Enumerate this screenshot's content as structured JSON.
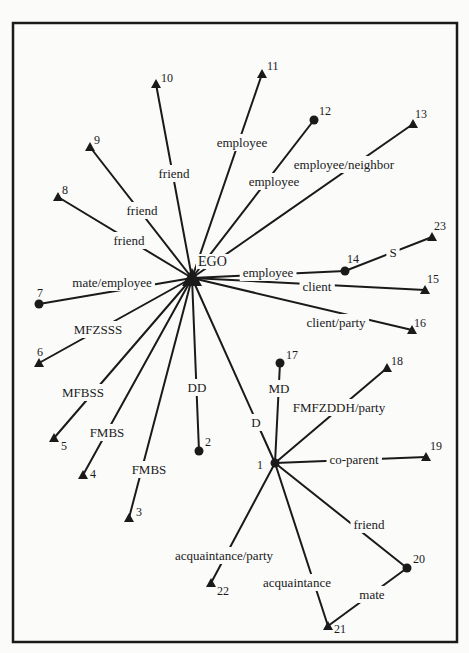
{
  "diagram": {
    "type": "ego-network",
    "frame": {
      "x": 13,
      "y": 23,
      "width": 444,
      "height": 619
    },
    "ego": {
      "id": "EGO",
      "label": "EGO",
      "shape": "triangle-large",
      "x": 192,
      "y": 278,
      "label_x": 198,
      "label_y": 266
    },
    "nodes": [
      {
        "id": "1",
        "label": "1",
        "shape": "circle",
        "x": 275,
        "y": 463,
        "lx": 257,
        "ly": 469
      },
      {
        "id": "2",
        "label": "2",
        "shape": "circle",
        "x": 199,
        "y": 451,
        "lx": 205,
        "ly": 446
      },
      {
        "id": "3",
        "label": "3",
        "shape": "triangle",
        "x": 129,
        "y": 518,
        "lx": 136,
        "ly": 516
      },
      {
        "id": "4",
        "label": "4",
        "shape": "triangle",
        "x": 83,
        "y": 475,
        "lx": 90,
        "ly": 478
      },
      {
        "id": "5",
        "label": "5",
        "shape": "triangle",
        "x": 54,
        "y": 438,
        "lx": 61,
        "ly": 450
      },
      {
        "id": "6",
        "label": "6",
        "shape": "triangle",
        "x": 39,
        "y": 363,
        "lx": 37,
        "ly": 356
      },
      {
        "id": "7",
        "label": "7",
        "shape": "circle",
        "x": 39,
        "y": 304,
        "lx": 37,
        "ly": 297
      },
      {
        "id": "8",
        "label": "8",
        "shape": "triangle",
        "x": 58,
        "y": 197,
        "lx": 62,
        "ly": 194
      },
      {
        "id": "9",
        "label": "9",
        "shape": "triangle",
        "x": 90,
        "y": 147,
        "lx": 94,
        "ly": 144
      },
      {
        "id": "10",
        "label": "10",
        "shape": "triangle",
        "x": 156,
        "y": 84,
        "lx": 161,
        "ly": 82
      },
      {
        "id": "11",
        "label": "11",
        "shape": "triangle",
        "x": 262,
        "y": 74,
        "lx": 267,
        "ly": 70
      },
      {
        "id": "12",
        "label": "12",
        "shape": "circle",
        "x": 314,
        "y": 120,
        "lx": 319,
        "ly": 115
      },
      {
        "id": "13",
        "label": "13",
        "shape": "triangle",
        "x": 413,
        "y": 124,
        "lx": 415,
        "ly": 118
      },
      {
        "id": "14",
        "label": "14",
        "shape": "circle",
        "x": 345,
        "y": 271,
        "lx": 347,
        "ly": 263
      },
      {
        "id": "15",
        "label": "15",
        "shape": "triangle",
        "x": 425,
        "y": 290,
        "lx": 427,
        "ly": 283
      },
      {
        "id": "16",
        "label": "16",
        "shape": "triangle",
        "x": 412,
        "y": 330,
        "lx": 414,
        "ly": 327
      },
      {
        "id": "17",
        "label": "17",
        "shape": "circle",
        "x": 280,
        "y": 363,
        "lx": 286,
        "ly": 359
      },
      {
        "id": "18",
        "label": "18",
        "shape": "triangle",
        "x": 387,
        "y": 368,
        "lx": 391,
        "ly": 365
      },
      {
        "id": "19",
        "label": "19",
        "shape": "triangle",
        "x": 426,
        "y": 457,
        "lx": 430,
        "ly": 450
      },
      {
        "id": "20",
        "label": "20",
        "shape": "circle",
        "x": 407,
        "y": 568,
        "lx": 413,
        "ly": 563
      },
      {
        "id": "21",
        "label": "21",
        "shape": "triangle",
        "x": 328,
        "y": 626,
        "lx": 334,
        "ly": 633
      },
      {
        "id": "22",
        "label": "22",
        "shape": "triangle",
        "x": 211,
        "y": 583,
        "lx": 217,
        "ly": 595
      },
      {
        "id": "23",
        "label": "23",
        "shape": "triangle",
        "x": 432,
        "y": 237,
        "lx": 434,
        "ly": 230
      }
    ],
    "edges": [
      {
        "from": "EGO",
        "to": "10",
        "label": "friend",
        "lx": 174,
        "ly": 175
      },
      {
        "from": "EGO",
        "to": "9",
        "label": "friend",
        "lx": 142,
        "ly": 212
      },
      {
        "from": "EGO",
        "to": "8",
        "label": "friend",
        "lx": 129,
        "ly": 242
      },
      {
        "from": "EGO",
        "to": "11",
        "label": "employee",
        "lx": 242,
        "ly": 144
      },
      {
        "from": "EGO",
        "to": "12",
        "label": "employee",
        "lx": 274,
        "ly": 183
      },
      {
        "from": "EGO",
        "to": "13",
        "label": "employee/neighbor",
        "lx": 344,
        "ly": 166
      },
      {
        "from": "EGO",
        "to": "14",
        "label": "employee",
        "lx": 268,
        "ly": 274
      },
      {
        "from": "14",
        "to": "23",
        "label": "S",
        "lx": 393,
        "ly": 254
      },
      {
        "from": "EGO",
        "to": "15",
        "label": "client",
        "lx": 317,
        "ly": 288
      },
      {
        "from": "EGO",
        "to": "16",
        "label": "client/party",
        "lx": 336,
        "ly": 324
      },
      {
        "from": "EGO",
        "to": "7",
        "label": "mate/employee",
        "lx": 112,
        "ly": 284
      },
      {
        "from": "EGO",
        "to": "6",
        "label": "MFZSSS",
        "lx": 98,
        "ly": 331
      },
      {
        "from": "EGO",
        "to": "5",
        "label": "MFBSS",
        "lx": 83,
        "ly": 394
      },
      {
        "from": "EGO",
        "to": "4",
        "label": "FMBS",
        "lx": 107,
        "ly": 434
      },
      {
        "from": "EGO",
        "to": "3",
        "label": "FMBS",
        "lx": 149,
        "ly": 471
      },
      {
        "from": "EGO",
        "to": "2",
        "label": "DD",
        "lx": 197,
        "ly": 389
      },
      {
        "from": "EGO",
        "to": "1",
        "label": "D",
        "lx": 256,
        "ly": 424
      },
      {
        "from": "1",
        "to": "17",
        "label": "MD",
        "lx": 279,
        "ly": 390
      },
      {
        "from": "1",
        "to": "18",
        "label": "FMFZDDH/party",
        "lx": 339,
        "ly": 409
      },
      {
        "from": "1",
        "to": "19",
        "label": "co-parent",
        "lx": 354,
        "ly": 461
      },
      {
        "from": "1",
        "to": "20",
        "label": "friend",
        "lx": 369,
        "ly": 526
      },
      {
        "from": "1",
        "to": "22",
        "label": "acquaintance/party",
        "lx": 224,
        "ly": 557
      },
      {
        "from": "1",
        "to": "21",
        "label": "acquaintance",
        "lx": 297,
        "ly": 584
      },
      {
        "from": "20",
        "to": "21",
        "label": "mate",
        "lx": 372,
        "ly": 596
      }
    ]
  }
}
